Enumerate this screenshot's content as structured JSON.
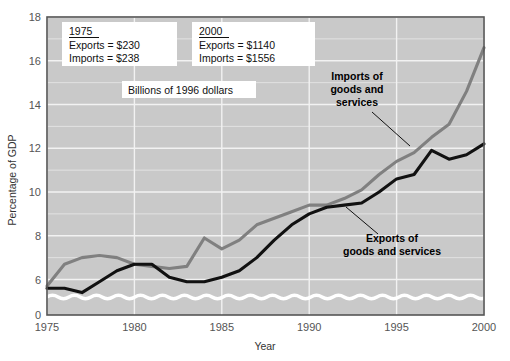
{
  "chart_data": {
    "type": "line",
    "title": "",
    "xlabel": "Year",
    "ylabel": "Percentage of GDP",
    "xlim": [
      1975,
      2000
    ],
    "ylim": [
      5,
      18
    ],
    "ylim_display_bottom": 0,
    "grid": true,
    "legend": "annotated-callouts",
    "axis_break": {
      "present": true,
      "between": [
        0,
        5
      ],
      "style": "white-wavy-line"
    },
    "xticks": [
      1975,
      1980,
      1985,
      1990,
      1995,
      2000
    ],
    "xtick_labels": [
      "1975",
      "1980",
      "1985",
      "1990",
      "1995",
      "2000"
    ],
    "yticks": [
      0,
      6,
      8,
      10,
      12,
      14,
      16,
      18
    ],
    "ytick_labels": [
      "0",
      "6",
      "8",
      "10",
      "12",
      "14",
      "16",
      "18"
    ],
    "x": [
      1975,
      1976,
      1977,
      1978,
      1979,
      1980,
      1981,
      1982,
      1983,
      1984,
      1985,
      1986,
      1987,
      1988,
      1989,
      1990,
      1991,
      1992,
      1993,
      1994,
      1995,
      1996,
      1997,
      1998,
      1999,
      2000
    ],
    "series": [
      {
        "name": "Imports of goods and services",
        "color": "#808080",
        "values": [
          5.7,
          6.7,
          7.0,
          7.1,
          7.0,
          6.7,
          6.6,
          6.5,
          6.6,
          7.9,
          7.4,
          7.8,
          8.5,
          8.8,
          9.1,
          9.4,
          9.4,
          9.7,
          10.1,
          10.8,
          11.4,
          11.8,
          12.5,
          13.1,
          14.6,
          16.6
        ]
      },
      {
        "name": "Exports of goods and services",
        "color": "#111111",
        "values": [
          5.6,
          5.6,
          5.4,
          5.9,
          6.4,
          6.7,
          6.7,
          6.1,
          5.9,
          5.9,
          6.1,
          6.4,
          7.0,
          7.8,
          8.5,
          9.0,
          9.3,
          9.4,
          9.5,
          10.0,
          10.6,
          10.8,
          11.9,
          11.5,
          11.7,
          12.2
        ]
      }
    ],
    "annotations": [
      {
        "id": "box-1975",
        "lines": [
          "1975",
          "Exports  =  $230",
          "Imports  =  $238"
        ],
        "underline_first": true
      },
      {
        "id": "box-2000",
        "lines": [
          "2000",
          "Exports  =  $1140",
          "Imports  =  $1556"
        ],
        "underline_first": true
      },
      {
        "id": "caption-units",
        "text": "Billions of 1996 dollars"
      },
      {
        "id": "callout-imports",
        "lines": [
          "Imports of",
          "goods and",
          "services"
        ],
        "leader": true
      },
      {
        "id": "callout-exports",
        "lines": [
          "Exports of",
          "goods and services"
        ],
        "leader": true
      }
    ]
  },
  "axes": {
    "ylabel": "Percentage of GDP",
    "xlabel": "Year",
    "xtick_labels": [
      "1975",
      "1980",
      "1985",
      "1990",
      "1995",
      "2000"
    ],
    "ytick_labels": [
      "18",
      "16",
      "14",
      "12",
      "10",
      "8",
      "6",
      "0"
    ]
  },
  "boxes": {
    "box1975": {
      "year": "1975",
      "exports": "Exports  =  $230",
      "imports": "Imports  =  $238"
    },
    "box2000": {
      "year": "2000",
      "exports": "Exports  =  $1140",
      "imports": "Imports  =  $1556"
    },
    "units_caption": "Billions of 1996 dollars"
  },
  "callouts": {
    "imports": {
      "line1": "Imports of",
      "line2": "goods and",
      "line3": "services"
    },
    "exports": {
      "line1": "Exports of",
      "line2": "goods and services"
    }
  },
  "colors": {
    "plot_background": "#c9c9c9",
    "gridline": "#f2f2f2",
    "imports_line": "#808080",
    "exports_line": "#111111",
    "border": "#555555",
    "page_background": "#ffffff"
  }
}
